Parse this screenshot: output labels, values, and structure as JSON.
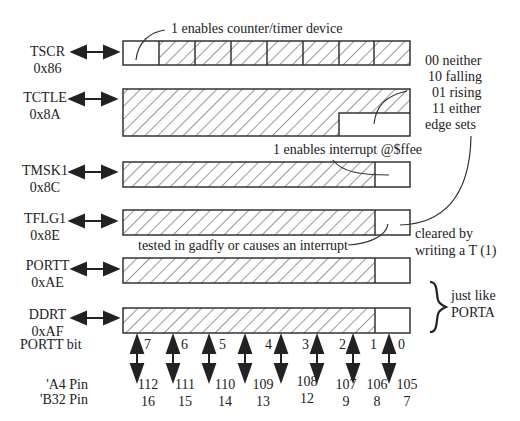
{
  "registers": [
    {
      "name": "TSCR",
      "address": "0x86"
    },
    {
      "name": "TCTLE",
      "address": "0x8A"
    },
    {
      "name": "TMSK1",
      "address": "0x8C"
    },
    {
      "name": "TFLG1",
      "address": "0x8E"
    },
    {
      "name": "PORTT",
      "address": "0xAE"
    },
    {
      "name": "DDRT",
      "address": "0xAF"
    }
  ],
  "annotations": {
    "tscr_note": "1 enables counter/timer device",
    "edge_codes": [
      "00 neither",
      "10 falling",
      "01 rising",
      "11 either",
      "edge sets"
    ],
    "tmsk1_note": "1 enables interrupt @$ffee",
    "tflg1_note": "tested in  gadfly or causes an interrupt",
    "cleared_note": [
      "cleared by",
      "writing a T (1)"
    ],
    "just_like": [
      "just like",
      "PORTA"
    ]
  },
  "bit_row_label": "PORTT bit",
  "bits": [
    "7",
    "6",
    "5",
    "4",
    "3",
    "2",
    "1",
    "0"
  ],
  "pin_labels": {
    "a4": "'A4 Pin",
    "b32": "'B32 Pin"
  },
  "a4_pins": [
    "112",
    "111",
    "110",
    "109",
    "108",
    "107",
    "106",
    "105"
  ],
  "b32_pins": [
    "16",
    "15",
    "14",
    "13",
    "12",
    "9",
    "8",
    "7"
  ]
}
